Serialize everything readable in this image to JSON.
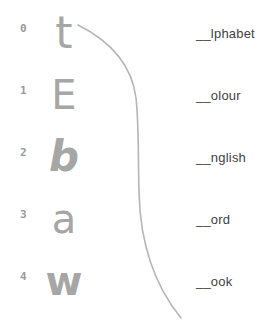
{
  "exercise": {
    "rows": [
      {
        "number": "0",
        "letter": "t",
        "word": "__lphabet"
      },
      {
        "number": "1",
        "letter": "E",
        "word": "__olour"
      },
      {
        "number": "2",
        "letter": "b",
        "word": "__nglish"
      },
      {
        "number": "3",
        "letter": "a",
        "word": "__ord"
      },
      {
        "number": "4",
        "letter": "w",
        "word": "__ook"
      }
    ]
  },
  "line": {
    "color": "#b5b5b5",
    "from_letter": "t"
  },
  "colors": {
    "background": "#ffffff",
    "number_text": "#999999",
    "letter_text": "#a6a6a6",
    "word_text": "#3f3f3f"
  }
}
